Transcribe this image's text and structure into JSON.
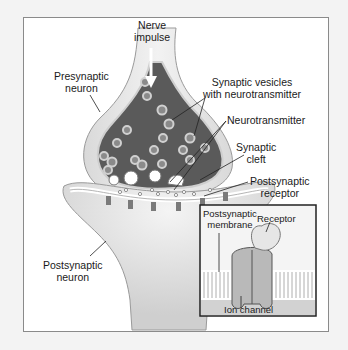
{
  "figure": {
    "labels": {
      "nerve_impulse": [
        "Nerve",
        "impulse"
      ],
      "presynaptic_neuron": [
        "Presynaptic",
        "neuron"
      ],
      "synaptic_vesicles": [
        "Synaptic vesicles",
        "with neurotransmitter"
      ],
      "neurotransmitter": "Neurotransmitter",
      "synaptic_cleft": [
        "Synaptic",
        "cleft"
      ],
      "postsynaptic_receptor": [
        "Postsynaptic",
        "receptor"
      ],
      "postsynaptic_neuron": [
        "Postsynaptic",
        "neuron"
      ]
    },
    "inset": {
      "postsynaptic_membrane": [
        "Postsynaptic",
        "membrane"
      ],
      "receptor": "Receptor",
      "ion_channel": "Ion channel"
    },
    "colors": {
      "background": "#f3f3f3",
      "frame_border": "#8a8a8a",
      "terminal_interior": "#5a5a5a",
      "neuron_fill": "#e2e2e2",
      "vesicle": "#c8c8c8",
      "inset_border": "#222222"
    }
  }
}
